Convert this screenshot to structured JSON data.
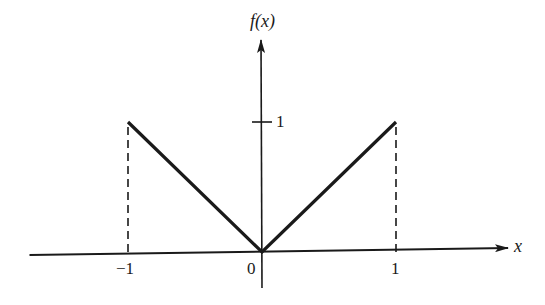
{
  "chart_data": {
    "type": "line",
    "title": "",
    "function_label": "f(x)",
    "xlabel": "x",
    "ylabel": "f(x)",
    "x_ticks": [
      {
        "value": -1,
        "label": "−1"
      },
      {
        "value": 0,
        "label": "0"
      },
      {
        "value": 1,
        "label": "1"
      }
    ],
    "y_ticks": [
      {
        "value": 1,
        "label": "1"
      }
    ],
    "xlim": [
      -1.75,
      1.85
    ],
    "ylim": [
      -0.3,
      1.6
    ],
    "grid": false,
    "legend": null,
    "series": [
      {
        "name": "f(x) = |x|",
        "style": "solid",
        "x": [
          -1,
          0,
          1
        ],
        "y": [
          1,
          0,
          1
        ]
      },
      {
        "name": "boundary x=-1",
        "style": "dashed",
        "x": [
          -1,
          -1
        ],
        "y": [
          0,
          1
        ]
      },
      {
        "name": "boundary x=1",
        "style": "dashed",
        "x": [
          1,
          1
        ],
        "y": [
          0,
          1
        ]
      }
    ]
  },
  "colors": {
    "ink": "#1a1a1a",
    "background": "#ffffff"
  },
  "geometry": {
    "origin_px": [
      262,
      252
    ],
    "unit_x_px": 134,
    "unit_y_px": 130
  }
}
